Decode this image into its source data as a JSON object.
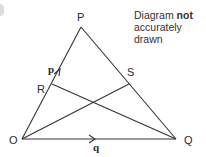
{
  "diagram": {
    "points": {
      "P": {
        "label": "P",
        "x": 81,
        "y": 27
      },
      "O": {
        "label": "O",
        "x": 22,
        "y": 139
      },
      "Q": {
        "label": "Q",
        "x": 176,
        "y": 139
      },
      "R": {
        "label": "R",
        "x": 52,
        "y": 84
      },
      "S": {
        "label": "S",
        "x": 129,
        "y": 84
      }
    },
    "segments": [
      [
        "O",
        "P"
      ],
      [
        "P",
        "Q"
      ],
      [
        "O",
        "Q"
      ],
      [
        "R",
        "Q"
      ],
      [
        "O",
        "S"
      ]
    ],
    "vectors": {
      "p": {
        "label": "p",
        "on": "OP"
      },
      "q": {
        "label": "q",
        "on": "OQ"
      }
    },
    "note": {
      "prefix": "Diagram ",
      "bold": "not",
      "line2": "accurately",
      "line3": "drawn"
    }
  }
}
